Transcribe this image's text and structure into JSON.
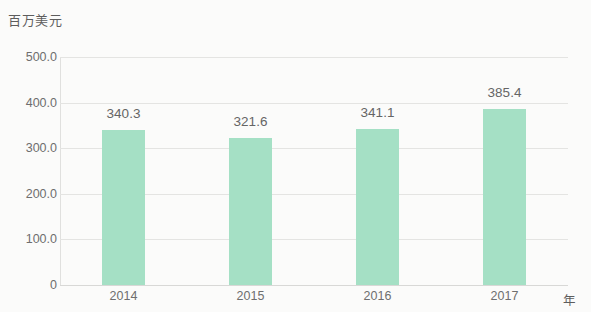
{
  "chart_data": {
    "type": "bar",
    "title": "",
    "subtitle": "",
    "xlabel": "年",
    "ylabel": "百万美元",
    "categories": [
      "2014",
      "2015",
      "2016",
      "2017"
    ],
    "values": [
      340.3,
      321.6,
      341.1,
      385.4
    ],
    "value_labels": [
      "340.3",
      "321.6",
      "341.1",
      "385.4"
    ],
    "series": [
      {
        "name": "",
        "values": [
          340.3,
          321.6,
          341.1,
          385.4
        ]
      }
    ],
    "ylim": [
      0,
      500
    ],
    "ytick_values": [
      500,
      400,
      300,
      200,
      100,
      0
    ],
    "ytick_labels": [
      "500.0",
      "400.0",
      "300.0",
      "200.0",
      "100.0",
      "0"
    ],
    "grid": true,
    "grid_axis": "y",
    "legend": false,
    "legend_position": "none",
    "bar_color": "#a5e0c5",
    "grid_color": "#e4e4e2",
    "text_color": "#6e6e6e",
    "background_color": "#fbfbfa"
  }
}
